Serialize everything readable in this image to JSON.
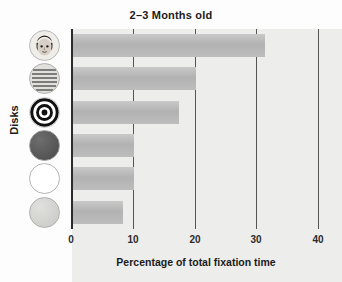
{
  "chart_data": {
    "type": "bar",
    "orientation": "horizontal",
    "title": "2–3 Months old",
    "xlabel": "Percentage of total fixation time",
    "ylabel": "Disks",
    "xlim": [
      0,
      40
    ],
    "xticks": [
      0,
      10,
      20,
      30,
      40
    ],
    "xtick_labels": [
      "0",
      "10",
      "20",
      "30",
      "40"
    ],
    "grid": true,
    "grid_axis": "x",
    "legend": "none",
    "categories": [
      "face",
      "newsprint",
      "bullseye",
      "red",
      "white",
      "yellow"
    ],
    "category_icons": [
      "face-disk-icon",
      "newsprint-disk-icon",
      "bullseye-disk-icon",
      "red-disk-icon",
      "white-disk-icon",
      "yellow-disk-icon"
    ],
    "values": [
      31.2,
      20.0,
      17.3,
      10.0,
      10.0,
      8.3
    ],
    "bar_color": "#b8b8b8",
    "background_color": "#ededec",
    "axis_color": "#2b2b2b"
  },
  "axis": {
    "tick_0": "0",
    "tick_10": "10",
    "tick_20": "20",
    "tick_30": "30",
    "tick_40": "40"
  }
}
